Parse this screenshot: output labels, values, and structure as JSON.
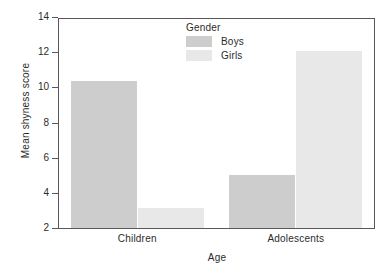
{
  "chart_data": {
    "type": "bar",
    "title": "",
    "xlabel": "Age",
    "ylabel": "Mean shyness score",
    "categories": [
      "Children",
      "Adolescents"
    ],
    "series": [
      {
        "name": "Boys",
        "values": [
          10.4,
          5.05
        ],
        "color": "#cdcdcd"
      },
      {
        "name": "Girls",
        "values": [
          3.2,
          12.15
        ],
        "color": "#e8e8e8"
      }
    ],
    "ylim": [
      2,
      14
    ],
    "yticks": [
      2,
      4,
      6,
      8,
      10,
      12,
      14
    ],
    "yticklabels": [
      "2",
      "4",
      "6",
      "8",
      "10",
      "12",
      "14"
    ],
    "grid": false,
    "legend": {
      "title": "Gender",
      "position": "upper-center",
      "entries": [
        {
          "label": "Boys",
          "color": "#cdcdcd"
        },
        {
          "label": "Girls",
          "color": "#e8e8e8"
        }
      ]
    },
    "axis_color": "#58585a",
    "text_color": "#2b2b2b",
    "background": "#ffffff"
  }
}
